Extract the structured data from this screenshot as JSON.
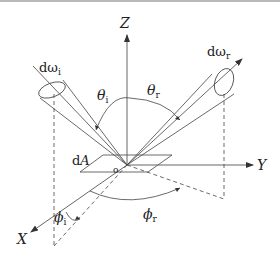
{
  "diagram": {
    "axes": {
      "z_label": "Z",
      "y_label": "Y",
      "x_label": "X"
    },
    "surface": {
      "area_label_d": "d",
      "area_label_A": "A",
      "origin_label": "o"
    },
    "incident": {
      "solid_angle_d": "d",
      "solid_angle_omega": "ω",
      "solid_angle_sub": "i",
      "theta": "θ",
      "theta_sub": "i",
      "phi": "ϕ",
      "phi_sub": "i"
    },
    "reflected": {
      "solid_angle_d": "d",
      "solid_angle_omega": "ω",
      "solid_angle_sub": "r",
      "theta": "θ",
      "theta_sub": "r",
      "phi": "ϕ",
      "phi_sub": "r"
    },
    "colors": {
      "line": "#333333",
      "border": "#b8b8b8"
    }
  }
}
